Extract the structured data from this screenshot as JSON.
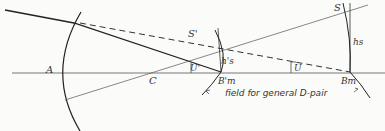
{
  "diagram": {
    "labels": {
      "A": "A",
      "C": "C",
      "S_prime": "S'",
      "S": "S",
      "h_s_prime": "h's",
      "h_s": "hs",
      "U_prime": "U'",
      "U": "U",
      "B_m_prime": "B'm",
      "B_m": "Bm"
    },
    "caption": "field for general D-pair"
  }
}
